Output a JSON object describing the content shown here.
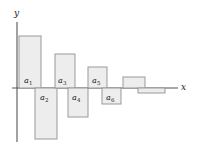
{
  "figure": {
    "background_color": "#ffffff",
    "bar_fill_color": "#ededed",
    "bar_stroke_color": "#999999",
    "axis_color": "#555555",
    "text_color": "#1a1a1a"
  },
  "axes": {
    "x_label": "x",
    "y_label": "y",
    "origin_x": 17,
    "baseline_y": 88,
    "x_axis_end": 178,
    "y_axis_top": 22,
    "y_axis_bottom": 142
  },
  "chart_data": {
    "type": "bar",
    "title": "",
    "xlabel": "x",
    "ylabel": "y",
    "grid": false,
    "legend": null,
    "categories": [
      "a1",
      "a2",
      "a3",
      "a4",
      "a5",
      "a6",
      "a7",
      "a8"
    ],
    "tick_labels": [
      "a₁",
      "a₂",
      "a₃",
      "a₄",
      "a₅",
      "a₆",
      "",
      ""
    ],
    "values": [
      52,
      -51,
      34,
      -29,
      21,
      -16,
      11,
      -5
    ],
    "xlim": [
      0,
      198
    ],
    "ylim": [
      -54,
      56
    ]
  },
  "bars": [
    {
      "name": "bar-a1",
      "label": "a",
      "sub": "1",
      "x": 19,
      "width": 22,
      "top": 36,
      "height": 52,
      "sign": "positive",
      "label_x": 24,
      "label_y": 77
    },
    {
      "name": "bar-a2",
      "label": "a",
      "sub": "2",
      "x": 35,
      "width": 22,
      "top": 88,
      "height": 51,
      "sign": "negative",
      "label_x": 40,
      "label_y": 94
    },
    {
      "name": "bar-a3",
      "label": "a",
      "sub": "3",
      "x": 55,
      "width": 20,
      "top": 54,
      "height": 34,
      "sign": "positive",
      "label_x": 58,
      "label_y": 77
    },
    {
      "name": "bar-a4",
      "label": "a",
      "sub": "4",
      "x": 68,
      "width": 20,
      "top": 88,
      "height": 29,
      "sign": "negative",
      "label_x": 72,
      "label_y": 94
    },
    {
      "name": "bar-a5",
      "label": "a",
      "sub": "5",
      "x": 88,
      "width": 19,
      "top": 67,
      "height": 21,
      "sign": "positive",
      "label_x": 92,
      "label_y": 77
    },
    {
      "name": "bar-a6",
      "label": "a",
      "sub": "6",
      "x": 102,
      "width": 19,
      "top": 88,
      "height": 16,
      "sign": "negative",
      "label_x": 106,
      "label_y": 94
    },
    {
      "name": "bar-a7",
      "label": "",
      "sub": "",
      "x": 123,
      "width": 22,
      "top": 77,
      "height": 11,
      "sign": "positive",
      "label_x": 0,
      "label_y": 0
    },
    {
      "name": "bar-a8",
      "label": "",
      "sub": "",
      "x": 138,
      "width": 27,
      "top": 88,
      "height": 5,
      "sign": "negative",
      "label_x": 0,
      "label_y": 0
    }
  ]
}
